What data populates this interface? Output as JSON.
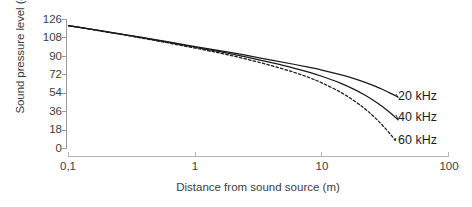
{
  "chart_data": {
    "type": "line",
    "title": "",
    "xlabel": "Distance from sound source (m)",
    "ylabel": "Sound pressure level (dB SPL)",
    "xscale": "log",
    "xlim": [
      0.1,
      100
    ],
    "ylim": [
      0,
      126
    ],
    "xticks": [
      "0,1",
      "1",
      "10",
      "100"
    ],
    "xtick_values": [
      0.1,
      1,
      10,
      100
    ],
    "yticks": [
      "0",
      "18",
      "36",
      "54",
      "72",
      "90",
      "108",
      "126"
    ],
    "ytick_values": [
      0,
      18,
      36,
      54,
      72,
      90,
      108,
      126
    ],
    "grid": false,
    "legend_position": "right-inline",
    "series": [
      {
        "name": "20 kHz",
        "style": "solid",
        "color": "#1a1a1a",
        "x": [
          0.1,
          0.2,
          0.35,
          0.6,
          1,
          1.6,
          2.5,
          4,
          6,
          8,
          10,
          14,
          18,
          22,
          26,
          30,
          35,
          40
        ],
        "y": [
          120.0,
          114.2,
          109.3,
          104.4,
          99.6,
          95.4,
          91.1,
          86.4,
          82.3,
          79.2,
          76.6,
          72.1,
          68.2,
          64.6,
          61.2,
          57.9,
          53.9,
          50.1
        ]
      },
      {
        "name": "40 kHz",
        "style": "solid",
        "color": "#1a1a1a",
        "x": [
          0.1,
          0.2,
          0.35,
          0.6,
          1,
          1.6,
          2.5,
          4,
          6,
          8,
          10,
          14,
          18,
          22,
          26,
          30,
          35,
          40
        ],
        "y": [
          120.0,
          114.0,
          109.0,
          103.9,
          98.9,
          94.3,
          89.4,
          83.8,
          78.6,
          74.4,
          70.6,
          63.9,
          57.8,
          52.0,
          46.4,
          41.0,
          34.4,
          28.0
        ]
      },
      {
        "name": "60 kHz",
        "style": "dashed",
        "color": "#1a1a1a",
        "x": [
          0.1,
          0.2,
          0.35,
          0.6,
          1,
          1.6,
          2.5,
          4,
          6,
          8,
          10,
          14,
          18,
          22,
          26,
          30,
          35,
          38
        ],
        "y": [
          120.0,
          113.8,
          108.6,
          103.3,
          98.0,
          93.0,
          87.5,
          80.9,
          74.5,
          69.1,
          64.1,
          55.1,
          46.6,
          38.5,
          30.6,
          22.9,
          13.5,
          7.9
        ]
      }
    ]
  },
  "axes": {
    "x_axis_color": "#9a9a9a",
    "y_axis_color": "#9a9a9a"
  }
}
